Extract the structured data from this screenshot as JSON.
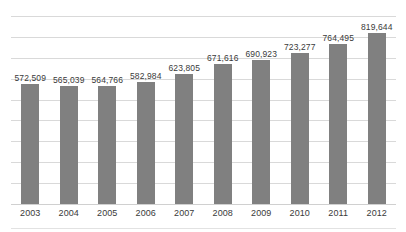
{
  "chart_data": {
    "type": "bar",
    "title": "",
    "subtitle": "",
    "xlabel": "",
    "ylabel": "",
    "categories": [
      "2003",
      "2004",
      "2005",
      "2006",
      "2007",
      "2008",
      "2009",
      "2010",
      "2011",
      "2012"
    ],
    "values": [
      572509,
      565039,
      564766,
      582984,
      623805,
      671616,
      690923,
      723277,
      764495,
      819644
    ],
    "value_labels": [
      "572,509",
      "565,039",
      "564,766",
      "582,984",
      "623,805",
      "671,616",
      "690,923",
      "723,277",
      "764,495",
      "819,644"
    ],
    "series": [
      {
        "name": "",
        "values": [
          572509,
          565039,
          564766,
          582984,
          623805,
          671616,
          690923,
          723277,
          764495,
          819644
        ]
      }
    ],
    "ylim": [
      0,
      900000
    ],
    "grid": true,
    "gridline_count": 9,
    "legend": false,
    "legend_position": "none",
    "axis_tick_labels_y": [],
    "annotations": []
  },
  "style": {
    "bar_color": "#808080",
    "gridline_color": "#d9d9d9",
    "axis_color": "#d0d0d0",
    "label_color": "#3a3a3a",
    "background": "#ffffff"
  }
}
